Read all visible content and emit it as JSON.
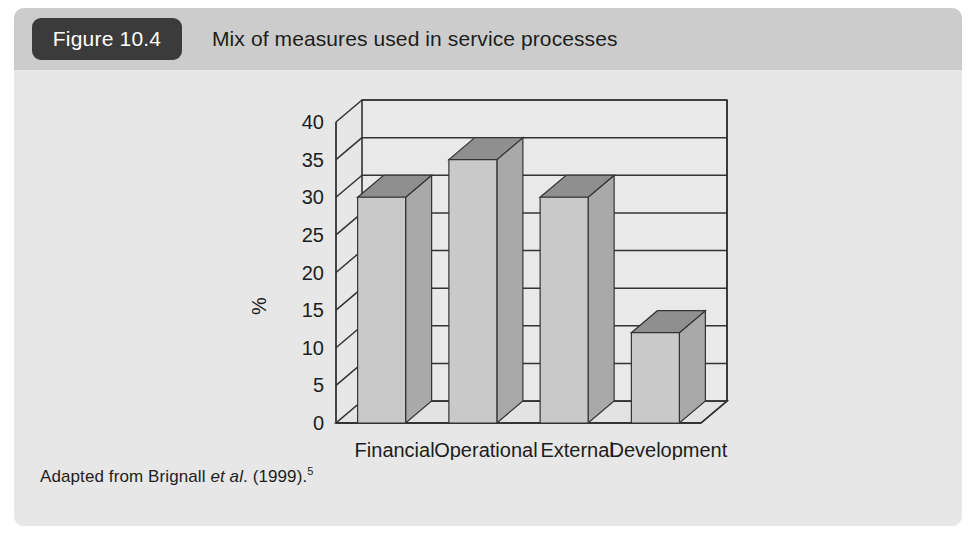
{
  "figure": {
    "badge": "Figure 10.4",
    "title": "Mix of measures used in service processes",
    "source_prefix": "Adapted from Brignall ",
    "source_italic": "et al",
    "source_suffix": ". (1999).",
    "source_superscript": "5"
  },
  "colors": {
    "card_background": "#e7e7e7",
    "header_background": "#cccccc",
    "badge_background": "#3b3b3b",
    "badge_text": "#ffffff",
    "text": "#1d1d1d",
    "bar_front": "#c9c9c9",
    "bar_side": "#a9a9a9",
    "bar_top": "#8f8f8f",
    "plot_outline": "#333333",
    "plot_floor": "#e3e3e3",
    "plot_back": "#e9e9e9"
  },
  "chart_data": {
    "type": "bar",
    "title": "Mix of measures used in service processes",
    "xlabel": "",
    "ylabel": "%",
    "categories": [
      "Financial",
      "Operational",
      "External",
      "Development"
    ],
    "values": [
      30,
      35,
      30,
      12
    ],
    "ylim": [
      0,
      40
    ],
    "yticks": [
      0,
      5,
      10,
      15,
      20,
      25,
      30,
      35,
      40
    ],
    "ytick_labels": [
      "0",
      "5",
      "10",
      "15",
      "20",
      "25",
      "30",
      "35",
      "40"
    ],
    "grid": true,
    "legend": "none",
    "style": "3d-column"
  }
}
